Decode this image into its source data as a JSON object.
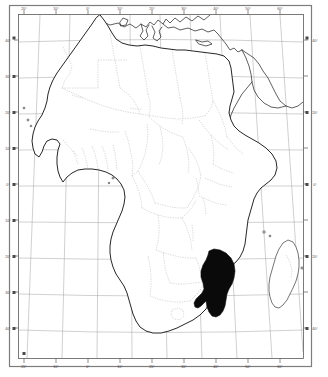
{
  "figure": {
    "projection_note": "graticule",
    "width": 328,
    "height": 377
  },
  "colors": {
    "background": "#ffffff",
    "frame": "#5a5a5a",
    "frame_outer": "#7d7d7d",
    "graticule": "#a8a8a8",
    "coastline": "#1a1a1a",
    "border": "#b5b5b5",
    "highlight": "#0a0a0a",
    "tick_label": "#4a4a4a"
  },
  "axes": {
    "longitude_unit": "°",
    "latitude_unit": "°",
    "top_labels": [
      "20°",
      "10°",
      "0°",
      "10°",
      "20°",
      "30°",
      "40°",
      "50°",
      "60°"
    ],
    "bottom_labels": [
      "20°",
      "10°",
      "0°",
      "10°",
      "20°",
      "30°",
      "40°",
      "50°",
      "60°"
    ],
    "left_labels": [
      "40°",
      "30°",
      "20°",
      "10°",
      "0°",
      "10°",
      "20°",
      "30°",
      "40°"
    ],
    "right_labels": [
      "40°",
      "30°",
      "20°",
      "10°",
      "0°",
      "10°",
      "20°",
      "30°",
      "40°"
    ],
    "lon_range": [
      -25,
      62
    ],
    "lat_range": [
      -38,
      40
    ],
    "grid": true
  },
  "layers": {
    "coastline_label": "Coastlines",
    "border_label": "National borders",
    "graticule_label": "Graticule",
    "highlight_label": "Mozambique"
  },
  "highlight": {
    "country": "Mozambique",
    "fill": "#0a0a0a"
  }
}
